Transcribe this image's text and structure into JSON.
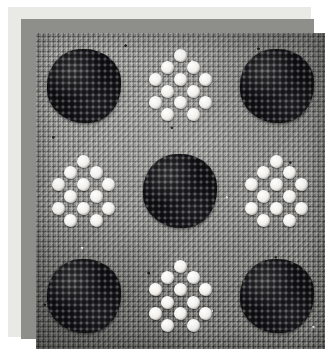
{
  "artwork": {
    "title": "Beaded needlepoint sampler",
    "description": "Photograph of a beadwork panel on woven gray canvas showing a three-by-three checkerboard of alternating dark bead clusters and white bead diamonds.",
    "frame": {
      "paper_margin_color": "#ffffff",
      "mat_color": "#e9e9e6",
      "keyline_color": "#8e8e8a"
    },
    "canvas": {
      "fabric_color": "#8c8c88",
      "fabric_label": "woven gray canvas",
      "weave_light_color": "#b6b6b1",
      "weave_dark_color": "#4a4a47"
    },
    "palette": {
      "dark_bead": "#16161a",
      "white_bead": "#f2f1ec",
      "bead_highlight": "#ffffff",
      "bead_shadow": "#cdcbc4"
    },
    "grid": {
      "rows": 3,
      "columns": 3,
      "cells": [
        {
          "row": 1,
          "column": 1,
          "motif": "dark-cluster",
          "color": "#16161a",
          "shape": "round"
        },
        {
          "row": 1,
          "column": 2,
          "motif": "white-diamond",
          "color": "#f2f1ec",
          "shape": "diamond",
          "bead_count": 13
        },
        {
          "row": 1,
          "column": 3,
          "motif": "dark-cluster",
          "color": "#16161a",
          "shape": "round"
        },
        {
          "row": 2,
          "column": 1,
          "motif": "white-diamond",
          "color": "#f2f1ec",
          "shape": "diamond",
          "bead_count": 13
        },
        {
          "row": 2,
          "column": 2,
          "motif": "dark-cluster",
          "color": "#16161a",
          "shape": "round"
        },
        {
          "row": 2,
          "column": 3,
          "motif": "white-diamond",
          "color": "#f2f1ec",
          "shape": "diamond",
          "bead_count": 13
        },
        {
          "row": 3,
          "column": 1,
          "motif": "dark-cluster",
          "color": "#16161a",
          "shape": "round"
        },
        {
          "row": 3,
          "column": 2,
          "motif": "white-diamond",
          "color": "#f2f1ec",
          "shape": "diamond",
          "bead_count": 13
        },
        {
          "row": 3,
          "column": 3,
          "motif": "dark-cluster",
          "color": "#16161a",
          "shape": "round"
        }
      ]
    },
    "bead_layout": {
      "note": "Percentage offsets of the 13 white beads forming one diamond motif.",
      "positions": [
        {
          "left": 41,
          "top": 2
        },
        {
          "left": 24,
          "top": 17
        },
        {
          "left": 58,
          "top": 17
        },
        {
          "left": 8,
          "top": 33
        },
        {
          "left": 41,
          "top": 33
        },
        {
          "left": 74,
          "top": 33
        },
        {
          "left": 24,
          "top": 49
        },
        {
          "left": 58,
          "top": 49
        },
        {
          "left": 8,
          "top": 64
        },
        {
          "left": 41,
          "top": 64
        },
        {
          "left": 74,
          "top": 64
        },
        {
          "left": 24,
          "top": 80
        },
        {
          "left": 58,
          "top": 80
        }
      ]
    }
  }
}
